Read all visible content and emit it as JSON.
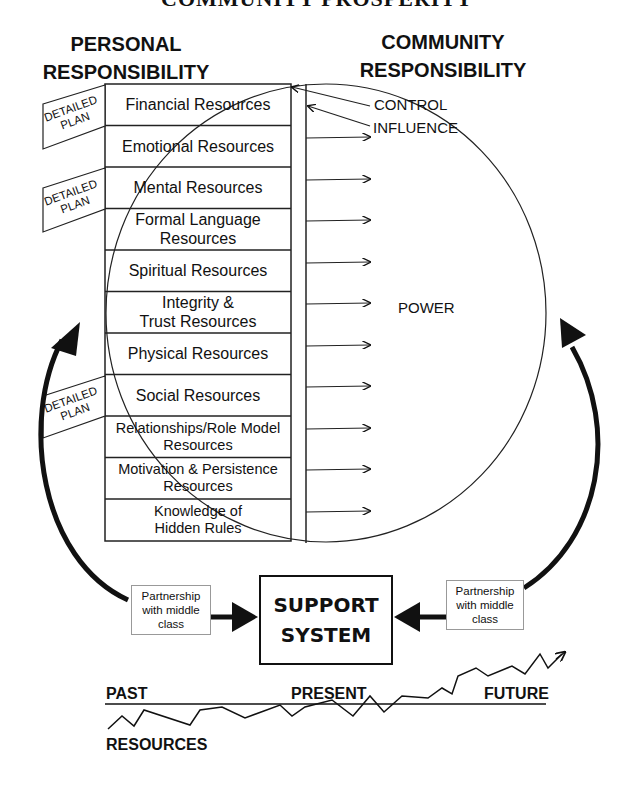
{
  "title": "COMMUNITY PROSPERITY",
  "headers": {
    "personal": [
      "PERSONAL",
      "RESPONSIBILITY"
    ],
    "community": [
      "COMMUNITY",
      "RESPONSIBILITY"
    ]
  },
  "resources": [
    {
      "label": "Financial Resources"
    },
    {
      "label": "Emotional Resources"
    },
    {
      "label": "Mental Resources"
    },
    {
      "label": "Formal Language Resources"
    },
    {
      "label": "Spiritual Resources"
    },
    {
      "label": "Integrity & Trust Resources"
    },
    {
      "label": "Physical Resources"
    },
    {
      "label": "Social Resources"
    },
    {
      "label": "Relationships/Role Model Resources"
    },
    {
      "label": "Motivation & Persistence Resources"
    },
    {
      "label": "Knowledge of Hidden Rules"
    }
  ],
  "resource_lines": {
    "r3": [
      "Formal Language",
      "Resources"
    ],
    "r5": [
      "Integrity &",
      "Trust Resources"
    ],
    "r8": [
      "Relationships/Role Model",
      "Resources"
    ],
    "r9": [
      "Motivation & Persistence",
      "Resources"
    ],
    "r10": [
      "Knowledge of",
      "Hidden Rules"
    ]
  },
  "detailed_plans": [
    {
      "line1": "DETAILED",
      "line2": "PLAN",
      "attached_to": "Financial Resources"
    },
    {
      "line1": "DETAILED",
      "line2": "PLAN",
      "attached_to": "Mental Resources"
    },
    {
      "line1": "DETAILED",
      "line2": "PLAN",
      "attached_to": "Social Resources"
    }
  ],
  "circle_labels": {
    "control": "CONTROL",
    "influence": "INFLUENCE",
    "power": "POWER"
  },
  "partnerships": {
    "left": [
      "Partnership",
      "with middle",
      "class"
    ],
    "right": [
      "Partnership",
      "with middle",
      "class"
    ]
  },
  "support_system": [
    "SUPPORT",
    "SYSTEM"
  ],
  "timeline": {
    "past": "PAST",
    "present": "PRESENT",
    "future": "FUTURE",
    "axis_label": "RESOURCES"
  }
}
